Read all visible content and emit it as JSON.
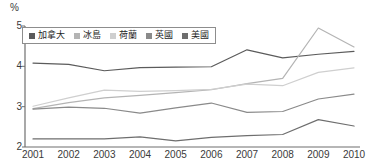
{
  "chart_data": {
    "type": "line",
    "title": "",
    "xlabel": "",
    "ylabel": "%",
    "unit_label": "%",
    "categories": [
      "2001",
      "2002",
      "2003",
      "2004",
      "2005",
      "2006",
      "2007",
      "2008",
      "2009",
      "2010"
    ],
    "x": [
      2001,
      2002,
      2003,
      2004,
      2005,
      2006,
      2007,
      2008,
      2009,
      2010
    ],
    "ylim": [
      2,
      5
    ],
    "y_ticks": [
      5,
      4,
      3,
      2
    ],
    "y_tick_labels": [
      "5",
      "4",
      "3",
      "2"
    ],
    "grid": false,
    "legend_position": "top-left",
    "series": [
      {
        "name": "加拿大",
        "color": "#5b5b5b",
        "values": [
          4.08,
          4.05,
          3.89,
          3.97,
          3.98,
          3.99,
          4.41,
          4.21,
          4.3,
          4.37
        ]
      },
      {
        "name": "冰島",
        "color": "#b4b4b4",
        "values": [
          2.95,
          3.1,
          3.22,
          3.28,
          3.35,
          3.42,
          3.57,
          3.7,
          4.95,
          4.48
        ]
      },
      {
        "name": "荷蘭",
        "color": "#cfcfcf",
        "values": [
          3.01,
          3.22,
          3.41,
          3.38,
          3.4,
          3.43,
          3.56,
          3.52,
          3.85,
          3.96
        ]
      },
      {
        "name": "英國",
        "color": "#8a8a8a",
        "values": [
          2.94,
          2.99,
          2.96,
          2.84,
          2.97,
          3.09,
          2.86,
          2.88,
          3.19,
          3.31
        ]
      },
      {
        "name": "美國",
        "color": "#6e6e6e",
        "values": [
          2.2,
          2.2,
          2.2,
          2.25,
          2.15,
          2.24,
          2.28,
          2.31,
          2.68,
          2.52
        ]
      }
    ]
  },
  "axis": {
    "y_unit": "%",
    "y_labels": [
      "5",
      "4",
      "3",
      "2"
    ],
    "x_labels": [
      "2001",
      "2002",
      "2003",
      "2004",
      "2005",
      "2006",
      "2007",
      "2008",
      "2009",
      "2010"
    ]
  },
  "legend": {
    "items": [
      {
        "label": "加拿大",
        "color": "#5b5b5b"
      },
      {
        "label": "冰島",
        "color": "#b4b4b4"
      },
      {
        "label": "荷蘭",
        "color": "#cfcfcf"
      },
      {
        "label": "英國",
        "color": "#8a8a8a"
      },
      {
        "label": "美國",
        "color": "#6e6e6e"
      }
    ]
  }
}
